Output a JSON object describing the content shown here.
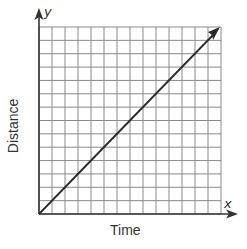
{
  "chart_data": {
    "type": "line",
    "title": "",
    "xlabel": "Time",
    "ylabel": "Distance",
    "x_axis_var": "x",
    "y_axis_var": "y",
    "grid": true,
    "grid_columns": 14,
    "grid_rows": 14,
    "xlim": [
      0,
      14
    ],
    "ylim": [
      0,
      14
    ],
    "series": [
      {
        "name": "distance-vs-time",
        "x": [
          0,
          14
        ],
        "y": [
          0,
          14
        ],
        "style": "straight line from origin with arrowhead at end"
      }
    ],
    "colors": {
      "grid": "#8a8a8a",
      "axis": "#333333",
      "line": "#2a2a2a"
    }
  }
}
